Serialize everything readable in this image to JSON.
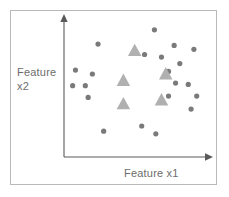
{
  "figure": {
    "background_color": "#ffffff",
    "frame_color": "#b9b9b9",
    "axis_color": "#5a5a5a"
  },
  "axes": {
    "x_label": "Feature x1",
    "y_label_line1": "Feature",
    "y_label_line2": "x2",
    "label_color": "#6d6d6d",
    "x_axis_name": "x-axis-arrow",
    "y_axis_name": "y-axis-arrow"
  },
  "chart_data": {
    "type": "scatter",
    "title": "",
    "xlabel": "Feature x1",
    "ylabel": "Feature x2",
    "xlim": [
      0,
      100
    ],
    "ylim": [
      0,
      100
    ],
    "grid": false,
    "legend": null,
    "axis_style": "arrow-axes-no-ticks",
    "series": [
      {
        "name": "circles",
        "marker": "circle",
        "color": "#7a7a7a",
        "marker_size": 5.2,
        "points": [
          {
            "x": 62.0,
            "y": 94.0
          },
          {
            "x": 22.0,
            "y": 83.0
          },
          {
            "x": 76.0,
            "y": 82.0
          },
          {
            "x": 55.0,
            "y": 75.0
          },
          {
            "x": 67.0,
            "y": 73.0
          },
          {
            "x": 90.0,
            "y": 79.0
          },
          {
            "x": 80.0,
            "y": 68.0
          },
          {
            "x": 6.0,
            "y": 63.0
          },
          {
            "x": 18.0,
            "y": 60.0
          },
          {
            "x": 72.0,
            "y": 62.0
          },
          {
            "x": 4.0,
            "y": 51.0
          },
          {
            "x": 13.0,
            "y": 51.0
          },
          {
            "x": 77.0,
            "y": 53.0
          },
          {
            "x": 86.0,
            "y": 52.0
          },
          {
            "x": 15.0,
            "y": 42.0
          },
          {
            "x": 72.0,
            "y": 43.0
          },
          {
            "x": 92.0,
            "y": 43.0
          },
          {
            "x": 88.0,
            "y": 33.0
          },
          {
            "x": 53.0,
            "y": 20.0
          },
          {
            "x": 26.0,
            "y": 16.0
          },
          {
            "x": 63.0,
            "y": 14.0
          }
        ]
      },
      {
        "name": "triangles",
        "marker": "triangle",
        "color": "#b0b0b0",
        "marker_size": 13.5,
        "points": [
          {
            "x": 48.0,
            "y": 78.0
          },
          {
            "x": 40.0,
            "y": 55.0
          },
          {
            "x": 70.0,
            "y": 60.0
          },
          {
            "x": 40.0,
            "y": 37.0
          },
          {
            "x": 67.0,
            "y": 40.0
          }
        ]
      }
    ]
  }
}
